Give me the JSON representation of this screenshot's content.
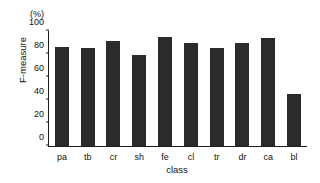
{
  "chart_data": {
    "type": "bar",
    "title": "",
    "subtitle": "",
    "xlabel": "class",
    "ylabel": "F-measure",
    "unit_label": "(%)",
    "categories": [
      "pa",
      "tb",
      "cr",
      "sh",
      "fe",
      "cl",
      "tr",
      "dr",
      "ca",
      "bl"
    ],
    "values": [
      86,
      85,
      91,
      79,
      95,
      90,
      85,
      90,
      94,
      45
    ],
    "ylim": [
      0,
      100
    ],
    "yticks": [
      0,
      20,
      40,
      60,
      80,
      100
    ],
    "ytick_labels": [
      "0",
      "20",
      "40",
      "60",
      "80",
      "100"
    ],
    "grid": false,
    "legend": false,
    "bar_color": "#2b2b2b",
    "axis_color": "#1a1a1a",
    "background_color": "#ffffff"
  }
}
